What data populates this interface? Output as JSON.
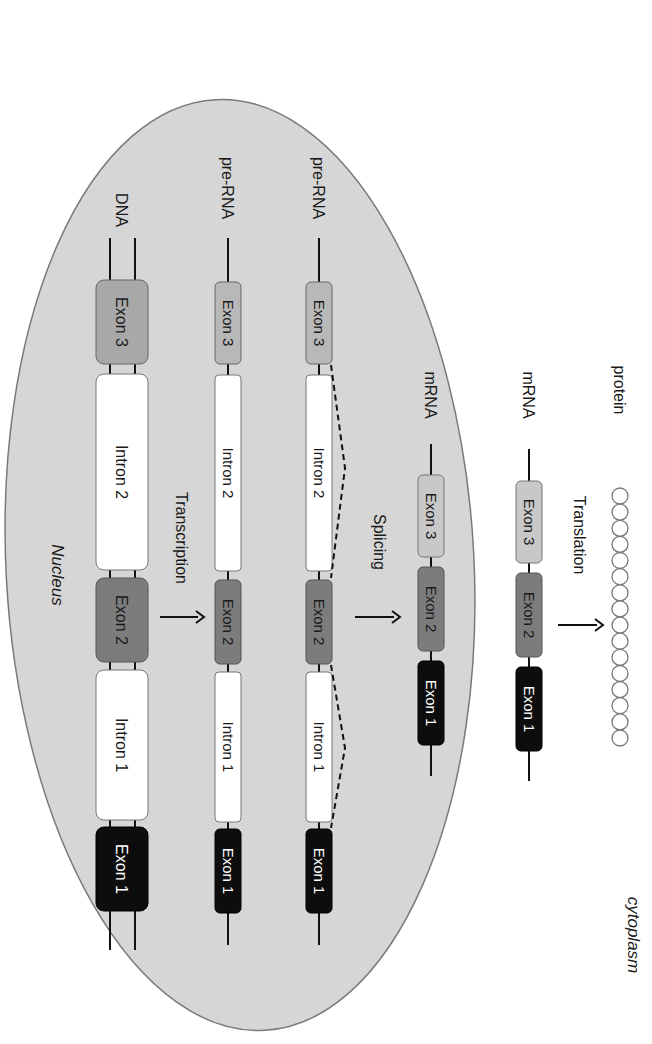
{
  "figure": {
    "orientation": "rotated 90 degrees clockwise",
    "regions": {
      "nucleus_label": "Nucleus",
      "cytoplasm_label": "cytoplasm"
    },
    "colors": {
      "nucleus_fill": "#d6d6d6",
      "nucleus_stroke": "#7a7a7a",
      "exon1": "#0d0d0d",
      "exon2": "#7c7c7c",
      "exon3_dna": "#a8a8a8",
      "exon3_rna": "#b8b8b8",
      "exon3_mrna": "#c8c8c8",
      "intron": "#ffffff",
      "line": "#111111"
    },
    "stages": [
      {
        "id": "dna",
        "label": "DNA",
        "strands": 2,
        "segments": [
          {
            "type": "exon",
            "label": "Exon 3",
            "shade": "exon3_dna"
          },
          {
            "type": "intron",
            "label": "Intron 2"
          },
          {
            "type": "exon",
            "label": "Exon 2",
            "shade": "exon2"
          },
          {
            "type": "intron",
            "label": "Intron 1"
          },
          {
            "type": "exon",
            "label": "Exon 1",
            "shade": "exon1"
          }
        ]
      },
      {
        "id": "pre-rna-1",
        "label": "pre-RNA",
        "strands": 1,
        "segments": [
          {
            "type": "exon",
            "label": "Exon 3",
            "shade": "exon3_rna"
          },
          {
            "type": "intron",
            "label": "Intron 2"
          },
          {
            "type": "exon",
            "label": "Exon 2",
            "shade": "exon2"
          },
          {
            "type": "intron",
            "label": "Intron 1"
          },
          {
            "type": "exon",
            "label": "Exon 1",
            "shade": "exon1"
          }
        ]
      },
      {
        "id": "pre-rna-2",
        "label": "pre-RNA",
        "strands": 1,
        "splicing_loops": true,
        "segments": [
          {
            "type": "exon",
            "label": "Exon 3",
            "shade": "exon3_rna"
          },
          {
            "type": "intron",
            "label": "Intron 2"
          },
          {
            "type": "exon",
            "label": "Exon 2",
            "shade": "exon2"
          },
          {
            "type": "intron",
            "label": "Intron 1"
          },
          {
            "type": "exon",
            "label": "Exon 1",
            "shade": "exon1"
          }
        ]
      },
      {
        "id": "mrna-nucleus",
        "label": "mRNA",
        "strands": 1,
        "segments": [
          {
            "type": "exon",
            "label": "Exon 3",
            "shade": "exon3_mrna"
          },
          {
            "type": "exon",
            "label": "Exon 2",
            "shade": "exon2"
          },
          {
            "type": "exon",
            "label": "Exon 1",
            "shade": "exon1"
          }
        ]
      },
      {
        "id": "mrna-cytoplasm",
        "label": "mRNA",
        "strands": 1,
        "segments": [
          {
            "type": "exon",
            "label": "Exon 3",
            "shade": "exon3_mrna"
          },
          {
            "type": "exon",
            "label": "Exon 2",
            "shade": "exon2"
          },
          {
            "type": "exon",
            "label": "Exon 1",
            "shade": "exon1"
          }
        ]
      },
      {
        "id": "protein",
        "label": "protein",
        "amino_acid_count": 16
      }
    ],
    "processes": [
      {
        "label": "Transcription",
        "from": "DNA",
        "to": "pre-RNA"
      },
      {
        "label": "Splicing",
        "from": "pre-RNA",
        "to": "mRNA"
      },
      {
        "label": "Translation",
        "from": "mRNA",
        "to": "protein"
      }
    ]
  }
}
